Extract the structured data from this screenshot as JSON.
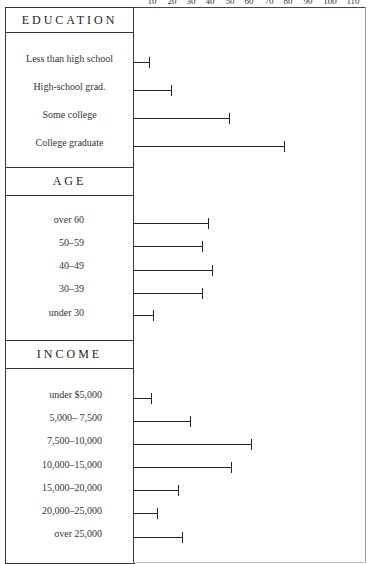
{
  "chart_data": {
    "type": "bar",
    "orientation": "horizontal",
    "title": "",
    "xlabel": "",
    "ylabel": "",
    "x_ticks": [
      10,
      20,
      30,
      40,
      50,
      60,
      70,
      80,
      90,
      100,
      110
    ],
    "xlim": [
      0,
      118
    ],
    "grid": false,
    "legend": null,
    "groups": [
      {
        "name": "EDUCATION",
        "categories": [
          "Less than  high school",
          "High-school grad.",
          "Some college",
          "College graduate"
        ],
        "values": [
          8,
          19,
          49,
          77
        ]
      },
      {
        "name": "AGE",
        "categories": [
          "over 60",
          "50–59",
          "40–49",
          "30–39",
          "under  30"
        ],
        "values": [
          38,
          35,
          40,
          35,
          10
        ]
      },
      {
        "name": "INCOME",
        "categories": [
          "under  $5,000",
          "5,000–  7,500",
          "7,500–10,000",
          "10,000–15,000",
          "15,000–20,000",
          "20,000–25,000",
          "over  25,000"
        ],
        "values": [
          9,
          29,
          60,
          50,
          23,
          12,
          25
        ]
      }
    ]
  },
  "axis": {
    "tick_labels": [
      "10",
      "20",
      "30",
      "40",
      "50",
      "60",
      "70",
      "80",
      "90",
      "100",
      "110"
    ]
  },
  "sections": {
    "education": {
      "title": "EDUCATION",
      "items": [
        "Less than  high school",
        "High-school grad.",
        "Some college",
        "College graduate"
      ]
    },
    "age": {
      "title": "AGE",
      "items": [
        "over 60",
        "50–59",
        "40–49",
        "30–39",
        "under  30"
      ]
    },
    "income": {
      "title": "INCOME",
      "items": [
        "under  $5,000",
        "5,000–  7,500",
        "7,500–10,000",
        "10,000–15,000",
        "15,000–20,000",
        "20,000–25,000",
        "over  25,000"
      ]
    }
  }
}
